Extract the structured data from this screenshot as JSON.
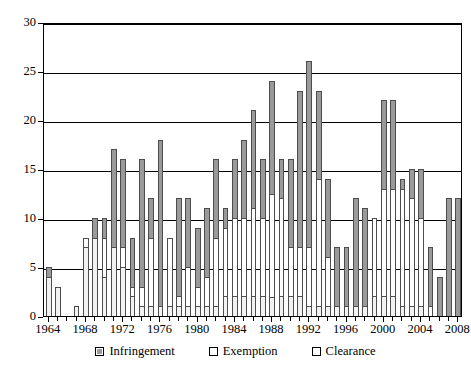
{
  "chart_data": {
    "type": "bar",
    "stacked": true,
    "title": "",
    "subtitle": "",
    "xlabel": "",
    "ylabel": "",
    "ylim": [
      0,
      30
    ],
    "ytick_values": [
      0,
      5,
      10,
      15,
      20,
      25,
      30
    ],
    "ytick_labels": [
      "0",
      "5",
      "10",
      "15",
      "20",
      "25",
      "30"
    ],
    "grid": true,
    "legend_position": "bottom",
    "x_tick_labels": [
      "1964",
      "1968",
      "1972",
      "1976",
      "1980",
      "1984",
      "1988",
      "1992",
      "1996",
      "2000",
      "2004",
      "2008"
    ],
    "categories": [
      "1964",
      "1965",
      "1966",
      "1967",
      "1968",
      "1969",
      "1970",
      "1971",
      "1972",
      "1973",
      "1974",
      "1975",
      "1976",
      "1977",
      "1978",
      "1979",
      "1980",
      "1981",
      "1982",
      "1983",
      "1984",
      "1985",
      "1986",
      "1987",
      "1988",
      "1989",
      "1990",
      "1991",
      "1992",
      "1993",
      "1994",
      "1995",
      "1996",
      "1997",
      "1998",
      "1999",
      "2000",
      "2001",
      "2002",
      "2003",
      "2004",
      "2005",
      "2006",
      "2007",
      "2008"
    ],
    "series": [
      {
        "name": "Clearance",
        "color": "#f2f2f2",
        "values": [
          4,
          3,
          0,
          1,
          7,
          8,
          4,
          7,
          5,
          2,
          1,
          1,
          1,
          1,
          1,
          1,
          1,
          1,
          1,
          2,
          2,
          2,
          2,
          2,
          2,
          2,
          2,
          2,
          1,
          1,
          1,
          1,
          1,
          1,
          1,
          2,
          2,
          2,
          1,
          1,
          1,
          0,
          0,
          0,
          0
        ]
      },
      {
        "name": "Exemption",
        "color": "#ffffff",
        "values": [
          0,
          0,
          0,
          0,
          1,
          0,
          4,
          0,
          2,
          1,
          2,
          7,
          0,
          7,
          1,
          4,
          2,
          3,
          7,
          7,
          8,
          8,
          9,
          8,
          11,
          10,
          5,
          5,
          6,
          13,
          5,
          0,
          0,
          0,
          0,
          8,
          11,
          11,
          12,
          11,
          9,
          1,
          0,
          0,
          0
        ]
      },
      {
        "name": "Infringement",
        "color": "#9a9a9a",
        "values": [
          1,
          0,
          0,
          0,
          0,
          2,
          2,
          10,
          9,
          5,
          13,
          4,
          17,
          0,
          10,
          7,
          6,
          7,
          8,
          2,
          6,
          8,
          10,
          6,
          12,
          4,
          9,
          16,
          19,
          9,
          8,
          6,
          6,
          11,
          10,
          0,
          9,
          9,
          1,
          3,
          5,
          6,
          4,
          12,
          12
        ]
      }
    ],
    "totals": [
      5,
      3,
      0,
      1,
      8,
      10,
      10,
      17,
      16,
      8,
      16,
      12,
      18,
      8,
      12,
      12,
      9,
      11,
      16,
      11,
      16,
      18,
      21,
      16,
      24,
      16,
      16,
      23,
      26,
      23,
      14,
      7,
      7,
      12,
      11,
      10,
      22,
      22,
      14,
      15,
      15,
      7,
      4,
      12,
      12
    ]
  },
  "legend": {
    "items": [
      {
        "label": "Infringement",
        "swatch": "infringement"
      },
      {
        "label": "Exemption",
        "swatch": "exemption"
      },
      {
        "label": "Clearance",
        "swatch": "clearance"
      }
    ]
  }
}
